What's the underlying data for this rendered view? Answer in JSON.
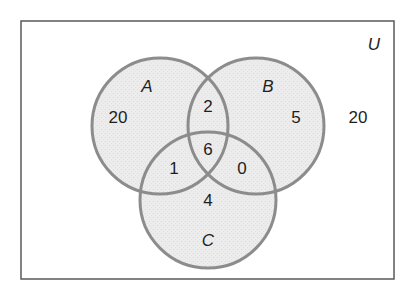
{
  "diagram": {
    "type": "venn",
    "universe_label": "U",
    "colors": {
      "frame": "#5a5a5a",
      "circle_stroke": "#8c8c8c",
      "circle_fill": "#ececec",
      "text": "#1e1e1e"
    },
    "sets": [
      {
        "label": "A"
      },
      {
        "label": "B"
      },
      {
        "label": "C"
      }
    ],
    "regions": {
      "only_A": "20",
      "only_B": "5",
      "only_C": "4",
      "A_and_B_only": "2",
      "A_and_C_only": "1",
      "B_and_C_only": "0",
      "A_and_B_and_C": "6",
      "outside": "20"
    }
  }
}
